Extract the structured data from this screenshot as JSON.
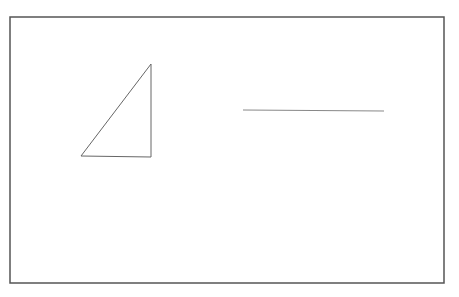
{
  "canvas": {
    "width": 459,
    "height": 297,
    "background": "#ffffff",
    "frame": {
      "x": 10,
      "y": 17,
      "width": 434,
      "height": 266,
      "stroke": "#555555"
    }
  },
  "shapes": {
    "triangle": {
      "points": "151,64 81,156 151,157",
      "stroke": "#666666"
    },
    "line": {
      "x1": 243,
      "y1": 110,
      "x2": 384,
      "y2": 111,
      "stroke": "#888888"
    }
  }
}
